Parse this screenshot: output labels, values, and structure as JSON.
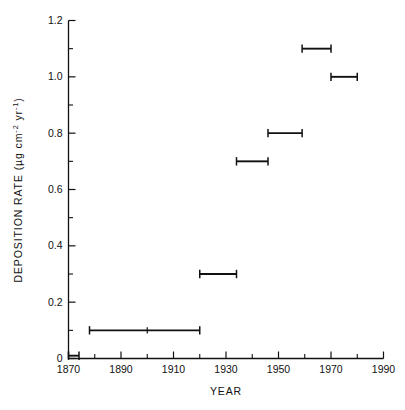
{
  "chart_data": {
    "type": "bar",
    "title": "",
    "subtitle": "",
    "xlabel": "YEAR",
    "ylabel": "DEPOSITION RATE (µg cm⁻² yr⁻¹)",
    "ylabel_parts": {
      "main": "DEPOSITION RATE (",
      "unit_mass": "µg cm",
      "exp_area": "-2",
      "unit_time": " yr",
      "exp_time": "-1",
      "close": ")"
    },
    "xlim": [
      1870,
      1990
    ],
    "ylim": [
      0,
      1.2
    ],
    "x_major_ticks": [
      1870,
      1890,
      1910,
      1930,
      1950,
      1970,
      1990
    ],
    "x_minor_ticks": [
      1880,
      1900,
      1920,
      1940,
      1960,
      1980
    ],
    "x_tick_labels": [
      "1870",
      "1890",
      "1910",
      "1930",
      "1950",
      "1970",
      "1990"
    ],
    "y_major_ticks": [
      0,
      0.2,
      0.4,
      0.6,
      0.8,
      1.0,
      1.2
    ],
    "y_minor_ticks": [
      0.1,
      0.3,
      0.5,
      0.7,
      0.9,
      1.1
    ],
    "y_tick_labels": [
      "0",
      "0.2",
      "0.4",
      "0.6",
      "0.8",
      "1.0",
      "1.2"
    ],
    "grid": false,
    "legend": null,
    "legend_position": "none",
    "marker_style": "horizontal-interval-bar-with-end-caps",
    "series": [
      {
        "name": "Deposition rate",
        "intervals": [
          {
            "label": "1870-1874",
            "x_start": 1870,
            "x_end": 1874,
            "value": 0.01,
            "midpoint": null
          },
          {
            "label": "1878-1920",
            "x_start": 1878,
            "x_end": 1920,
            "value": 0.1,
            "midpoint": 1900
          },
          {
            "label": "1920-1934",
            "x_start": 1920,
            "x_end": 1934,
            "value": 0.3,
            "midpoint": null
          },
          {
            "label": "1934-1946",
            "x_start": 1934,
            "x_end": 1946,
            "value": 0.7,
            "midpoint": null
          },
          {
            "label": "1946-1959",
            "x_start": 1946,
            "x_end": 1959,
            "value": 0.8,
            "midpoint": null
          },
          {
            "label": "1959-1970",
            "x_start": 1959,
            "x_end": 1970,
            "value": 1.1,
            "midpoint": null
          },
          {
            "label": "1970-1980",
            "x_start": 1970,
            "x_end": 1980,
            "value": 1.0,
            "midpoint": null
          }
        ]
      }
    ]
  },
  "colors": {
    "background": "#ffffff",
    "ink": "#111111"
  }
}
